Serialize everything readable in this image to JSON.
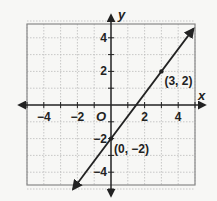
{
  "chart_data": {
    "type": "line",
    "title": "",
    "xlabel": "x",
    "ylabel": "y",
    "xlim": [
      -5,
      5
    ],
    "ylim": [
      -5,
      5
    ],
    "grid": true,
    "x_ticks": [
      "-4",
      "-2",
      "2",
      "4"
    ],
    "y_ticks": [
      "4",
      "2",
      "-2",
      "-4"
    ],
    "origin_label": "O",
    "series": [
      {
        "name": "line",
        "equation": "y = (4/3)x - 2",
        "x": [
          -2.25,
          4.9
        ],
        "y": [
          -5,
          4.53
        ]
      }
    ],
    "points": [
      {
        "x": 3,
        "y": 2,
        "label": "(3, 2)"
      },
      {
        "x": 0,
        "y": -2,
        "label": "(0, -2)"
      }
    ],
    "colors": {
      "line": "#222222",
      "grid": "#bbbbbb",
      "border": "#888888",
      "background": "#f7f7f5"
    }
  }
}
